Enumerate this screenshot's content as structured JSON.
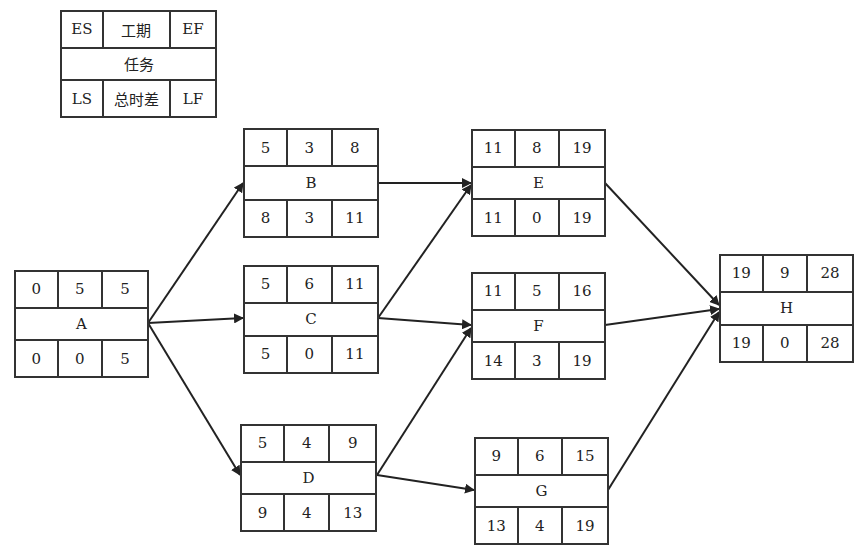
{
  "legend": {
    "top": [
      "ES",
      "工期",
      "EF"
    ],
    "name": "任务",
    "bottom": [
      "LS",
      "总时差",
      "LF"
    ]
  },
  "nodes": {
    "A": {
      "name": "A",
      "top": [
        "0",
        "5",
        "5"
      ],
      "bottom": [
        "0",
        "0",
        "5"
      ]
    },
    "B": {
      "name": "B",
      "top": [
        "5",
        "3",
        "8"
      ],
      "bottom": [
        "8",
        "3",
        "11"
      ]
    },
    "C": {
      "name": "C",
      "top": [
        "5",
        "6",
        "11"
      ],
      "bottom": [
        "5",
        "0",
        "11"
      ]
    },
    "D": {
      "name": "D",
      "top": [
        "5",
        "4",
        "9"
      ],
      "bottom": [
        "9",
        "4",
        "13"
      ]
    },
    "E": {
      "name": "E",
      "top": [
        "11",
        "8",
        "19"
      ],
      "bottom": [
        "11",
        "0",
        "19"
      ]
    },
    "F": {
      "name": "F",
      "top": [
        "11",
        "5",
        "16"
      ],
      "bottom": [
        "14",
        "3",
        "19"
      ]
    },
    "G": {
      "name": "G",
      "top": [
        "9",
        "6",
        "15"
      ],
      "bottom": [
        "13",
        "4",
        "19"
      ]
    },
    "H": {
      "name": "H",
      "top": [
        "19",
        "9",
        "28"
      ],
      "bottom": [
        "19",
        "0",
        "28"
      ]
    }
  },
  "edges": [
    [
      "A",
      "B"
    ],
    [
      "A",
      "C"
    ],
    [
      "A",
      "D"
    ],
    [
      "B",
      "E"
    ],
    [
      "C",
      "E"
    ],
    [
      "C",
      "F"
    ],
    [
      "D",
      "F"
    ],
    [
      "D",
      "G"
    ],
    [
      "E",
      "H"
    ],
    [
      "F",
      "H"
    ],
    [
      "G",
      "H"
    ]
  ],
  "colors": {
    "line": "#333333",
    "background": "#ffffff"
  }
}
